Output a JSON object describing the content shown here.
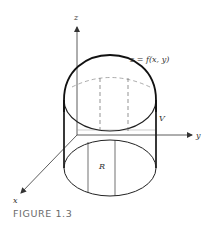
{
  "figure": {
    "caption": "FIGURE 1.3",
    "labels": {
      "z_axis": "z",
      "y_axis": "y",
      "x_axis": "x",
      "surface": "z = f(x, y)",
      "volume": "V",
      "region": "R"
    },
    "colors": {
      "stroke": "#222222",
      "dashed": "#888888",
      "axis": "#333333",
      "caption": "#6a6a6a"
    }
  }
}
